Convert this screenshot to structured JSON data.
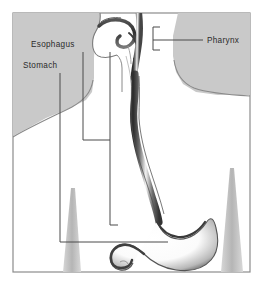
{
  "figure": {
    "frame": {
      "border_color": "#8c8c8c",
      "fill_color": "#ffffff"
    },
    "palette": {
      "background_shade": "#c9c9c9",
      "body_fill": "#ffffff",
      "outline": "#6e6e6e",
      "organ_dark": "#3a3a3a",
      "organ_light": "#ffffff",
      "leader_line": "#4a4a4a",
      "label_text": "#2b2b2b",
      "arm_shade": "#bdbdbd"
    },
    "labels": [
      {
        "id": "esophagus",
        "text": "Esophagus",
        "x": 31,
        "y": 47
      },
      {
        "id": "stomach",
        "text": "Stomach",
        "x": 23,
        "y": 68
      },
      {
        "id": "pharynx",
        "text": "Pharynx",
        "x": 207,
        "y": 44
      }
    ],
    "structures": [
      {
        "id": "head-profile",
        "name": "head-and-neck-profile"
      },
      {
        "id": "oral-cavity",
        "name": "oral-cavity"
      },
      {
        "id": "tongue",
        "name": "tongue"
      },
      {
        "id": "pharynx-organ",
        "name": "pharynx"
      },
      {
        "id": "esophagus-organ",
        "name": "esophagus"
      },
      {
        "id": "stomach-organ",
        "name": "stomach"
      },
      {
        "id": "duodenum-organ",
        "name": "duodenum"
      },
      {
        "id": "torso",
        "name": "torso-silhouette"
      },
      {
        "id": "left-arm",
        "name": "left-arm"
      },
      {
        "id": "right-arm",
        "name": "right-arm"
      }
    ]
  }
}
